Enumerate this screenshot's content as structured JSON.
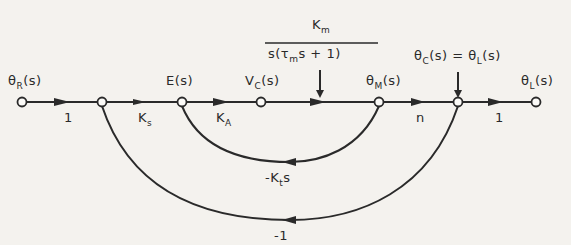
{
  "diagram": {
    "type": "signal-flow-graph",
    "nodes": [
      {
        "id": "n1",
        "label_main": "θ",
        "label_sub": "R",
        "label_tail": "(s)"
      },
      {
        "id": "n2",
        "label_main": "",
        "label_sub": "",
        "label_tail": ""
      },
      {
        "id": "n3",
        "label_main": "E(s)",
        "label_sub": "",
        "label_tail": ""
      },
      {
        "id": "n4",
        "label_main": "V",
        "label_sub": "C",
        "label_tail": "(s)"
      },
      {
        "id": "n5",
        "label_main": "θ",
        "label_sub": "M",
        "label_tail": "(s)"
      },
      {
        "id": "n6",
        "label_main": "θ",
        "label_sub": "C",
        "label_tail": "(s) = θ"
      },
      {
        "id": "n7",
        "label_main": "θ",
        "label_sub": "L",
        "label_tail": "(s)"
      }
    ],
    "node6_label": {
      "part1": "θ",
      "sub1": "C",
      "part2": "(s) = θ",
      "sub2": "L",
      "part3": "(s)"
    },
    "forward_branches": [
      {
        "from": "n1",
        "to": "n2",
        "gain": "1"
      },
      {
        "from": "n2",
        "to": "n3",
        "gain_main": "K",
        "gain_sub": "s"
      },
      {
        "from": "n3",
        "to": "n4",
        "gain_main": "K",
        "gain_sub": "A"
      },
      {
        "from": "n4",
        "to": "n5",
        "gain_num_main": "K",
        "gain_num_sub": "m",
        "gain_den_a": "s(",
        "gain_den_tau": "τ",
        "gain_den_tau_sub": "m",
        "gain_den_b": "s + 1)"
      },
      {
        "from": "n5",
        "to": "n6",
        "gain": "n"
      },
      {
        "from": "n6",
        "to": "n7",
        "gain": "1"
      }
    ],
    "feedback_branches": [
      {
        "from": "n5",
        "to": "n3",
        "gain_a": "-K",
        "gain_sub": "t",
        "gain_b": "s"
      },
      {
        "from": "n6",
        "to": "n2",
        "gain": "-1"
      }
    ]
  }
}
